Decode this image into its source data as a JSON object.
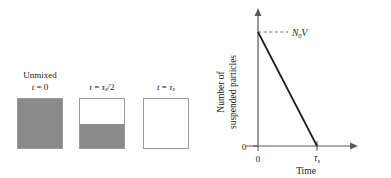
{
  "figure": {
    "colors": {
      "suspension_gray": "#8a8a8a",
      "clear_white": "#ffffff",
      "box_border": "#9a9a9a",
      "axis": "#595959",
      "curve": "#1a1a1a",
      "dashed_guide": "#666666"
    }
  },
  "left_panel": {
    "name": "beaker-series",
    "unmixed_label": "Unmixed",
    "beakers": [
      {
        "id": "beaker-t0",
        "time_label_prefix": "t",
        "time_label_equals": " = ",
        "time_label_value": "0",
        "fill_fraction": 1.0,
        "fill_percent_label": "100"
      },
      {
        "id": "beaker-half-tau",
        "time_label_prefix": "t",
        "time_label_equals": " = ",
        "time_label_value": "τ",
        "time_label_sub": "s",
        "time_label_suffix": "/2",
        "fill_fraction": 0.5,
        "fill_percent_label": "50"
      },
      {
        "id": "beaker-tau",
        "time_label_prefix": "t",
        "time_label_equals": " = ",
        "time_label_value": "τ",
        "time_label_sub": "s",
        "time_label_suffix": "",
        "fill_fraction": 0.0,
        "fill_percent_label": "0"
      }
    ]
  },
  "chart_data": {
    "type": "line",
    "title": "",
    "xlabel": "Time",
    "ylabel": "Number of suspended particles",
    "ylabel_line1": "Number of",
    "ylabel_line2": "suspended particles",
    "x": [
      0,
      1
    ],
    "y": [
      1,
      0
    ],
    "xlim": [
      0,
      1.65
    ],
    "ylim": [
      0,
      1.18
    ],
    "xticks": [
      0,
      1
    ],
    "xticklabels": [
      "0",
      "τ"
    ],
    "xticklabel_subs": [
      "",
      "s"
    ],
    "yticks": [
      0
    ],
    "yticklabels": [
      "0"
    ],
    "grid": false,
    "legend": false,
    "series": [
      {
        "name": "suspended particle count",
        "values": [
          1,
          0
        ],
        "x": [
          0,
          1
        ],
        "style": "solid",
        "linewidth": 1.6
      }
    ],
    "annotations": [
      {
        "name": "initial-value-annotation",
        "text": "N",
        "sub": "0",
        "suffix": "V",
        "x": 0,
        "y": 1,
        "guide": "dashed-horizontal"
      }
    ],
    "tau_symbol": "τ",
    "tau_sub": "s"
  }
}
